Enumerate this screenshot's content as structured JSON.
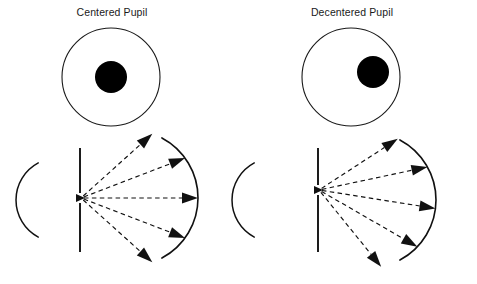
{
  "figure": {
    "title_left": "Centered Pupil",
    "title_right": "Decentered Pupil",
    "caption": "",
    "background_color": "#ffffff",
    "ink_color": "#111111"
  },
  "panels": [
    {
      "id": "centered",
      "label": "Centered Pupil",
      "iris": {
        "cx": 111,
        "cy": 77,
        "r": 49,
        "stroke": "#1a1a1a",
        "fill": "#ffffff"
      },
      "pupil": {
        "cx": 111,
        "cy": 77,
        "r": 16,
        "fill": "#000000",
        "offset_x": 0,
        "offset_y": 0
      },
      "cornea_arc": {
        "cx": 58,
        "cy": 200,
        "r": 42,
        "start_deg": -62,
        "end_deg": 62
      },
      "aperture_plane": {
        "x": 80,
        "y_top": 148,
        "y_bottom": 252,
        "gap_top": 193,
        "gap_bottom": 203
      },
      "source_point": {
        "x": 81,
        "y": 198
      },
      "retina_arc": {
        "cx": 130,
        "cy": 198,
        "r": 68,
        "start_deg": -62,
        "end_deg": 62
      },
      "ray_count": 5,
      "ray_angles_deg": [
        -42,
        -21,
        0,
        21,
        42
      ],
      "symmetric": true
    },
    {
      "id": "decentered",
      "label": "Decentered Pupil",
      "iris": {
        "cx": 351,
        "cy": 77,
        "r": 49,
        "stroke": "#1a1a1a",
        "fill": "#ffffff"
      },
      "pupil": {
        "cx": 373,
        "cy": 72,
        "r": 16,
        "fill": "#000000",
        "offset_x": 22,
        "offset_y": -5
      },
      "cornea_arc": {
        "cx": 274,
        "cy": 200,
        "r": 42,
        "start_deg": -62,
        "end_deg": 62
      },
      "aperture_plane": {
        "x": 318,
        "y_top": 148,
        "y_bottom": 252,
        "gap_top": 185,
        "gap_bottom": 195
      },
      "source_point": {
        "x": 319,
        "y": 190
      },
      "retina_arc": {
        "cx": 368,
        "cy": 200,
        "r": 68,
        "start_deg": -62,
        "end_deg": 62
      },
      "ray_count": 5,
      "ray_angles_deg": [
        -33,
        -12,
        9,
        30,
        51
      ],
      "symmetric": false
    }
  ],
  "legend": {
    "solid_arc_name": "cornea",
    "vertical_line_name": "pupil-plane",
    "dashed_line_name": "light-ray",
    "arrowhead_name": "ray-arrowhead"
  }
}
